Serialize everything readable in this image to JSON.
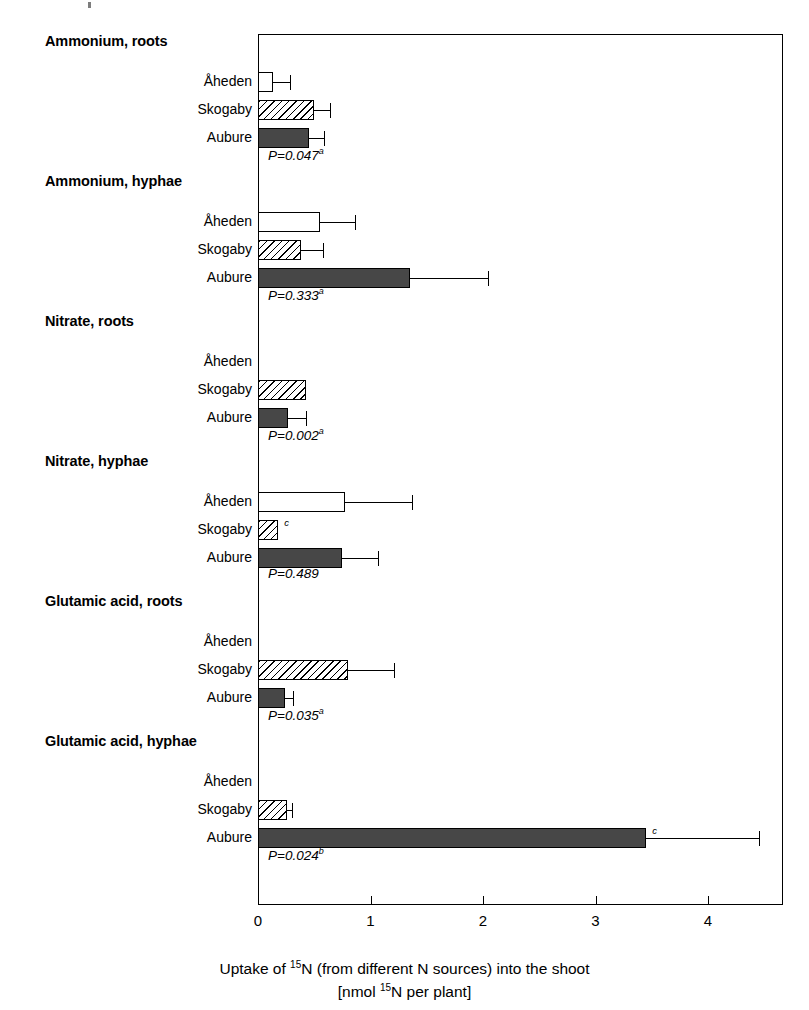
{
  "chart_data": {
    "type": "bar",
    "orientation": "horizontal",
    "title": "",
    "xlabel_line1": "Uptake of ",
    "xlabel_sup1": "15",
    "xlabel_line1b": "N (from different N sources) into the shoot",
    "xlabel_line2a": "[nmol ",
    "xlabel_sup2": "15",
    "xlabel_line2b": "N per plant]",
    "xlabel_plain": "Uptake of 15N (from different N sources) into the shoot [nmol 15N per plant]",
    "ylabel": "",
    "xlim": [
      0,
      4.666
    ],
    "xticks": [
      0,
      1,
      2,
      3,
      4
    ],
    "xticklabels": [
      "0",
      "1",
      "2",
      "3",
      "4"
    ],
    "grid": false,
    "legend_position": "none",
    "site_names": [
      "Åheden",
      "Skogaby",
      "Aubure"
    ],
    "site_styles": [
      "open",
      "hatched",
      "solid"
    ],
    "groups": [
      {
        "header": "Ammonium, roots",
        "p_value": "P=0.047",
        "p_sup": "a",
        "bars": [
          {
            "site": "Åheden",
            "value": 0.13,
            "error": 0.15,
            "marker": ""
          },
          {
            "site": "Skogaby",
            "value": 0.5,
            "error": 0.14,
            "marker": ""
          },
          {
            "site": "Aubure",
            "value": 0.45,
            "error": 0.14,
            "marker": ""
          }
        ]
      },
      {
        "header": "Ammonium, hyphae",
        "p_value": "P=0.333",
        "p_sup": "a",
        "bars": [
          {
            "site": "Åheden",
            "value": 0.55,
            "error": 0.31,
            "marker": ""
          },
          {
            "site": "Skogaby",
            "value": 0.38,
            "error": 0.2,
            "marker": ""
          },
          {
            "site": "Aubure",
            "value": 1.35,
            "error": 0.69,
            "marker": ""
          }
        ]
      },
      {
        "header": "Nitrate, roots",
        "p_value": "P=0.002",
        "p_sup": "a",
        "bars": [
          {
            "site": "Åheden",
            "value": 0.0,
            "error": 0.0,
            "marker": ""
          },
          {
            "site": "Skogaby",
            "value": 0.43,
            "error": 0.0,
            "marker": ""
          },
          {
            "site": "Aubure",
            "value": 0.27,
            "error": 0.16,
            "marker": ""
          }
        ]
      },
      {
        "header": "Nitrate, hyphae",
        "p_value": "P=0.489",
        "p_sup": "",
        "bars": [
          {
            "site": "Åheden",
            "value": 0.77,
            "error": 0.6,
            "marker": ""
          },
          {
            "site": "Skogaby",
            "value": 0.18,
            "error": 0.0,
            "marker": "c"
          },
          {
            "site": "Aubure",
            "value": 0.75,
            "error": 0.32,
            "marker": ""
          }
        ]
      },
      {
        "header": "Glutamic acid, roots",
        "p_value": "P=0.035",
        "p_sup": "a",
        "bars": [
          {
            "site": "Åheden",
            "value": 0.0,
            "error": 0.0,
            "marker": ""
          },
          {
            "site": "Skogaby",
            "value": 0.8,
            "error": 0.41,
            "marker": ""
          },
          {
            "site": "Aubure",
            "value": 0.24,
            "error": 0.07,
            "marker": ""
          }
        ]
      },
      {
        "header": "Glutamic acid, hyphae",
        "p_value": "P=0.024",
        "p_sup": "b",
        "bars": [
          {
            "site": "Åheden",
            "value": 0.0,
            "error": 0.0,
            "marker": ""
          },
          {
            "site": "Skogaby",
            "value": 0.26,
            "error": 0.04,
            "marker": ""
          },
          {
            "site": "Aubure",
            "value": 3.45,
            "error": 1.0,
            "marker": "c"
          }
        ]
      }
    ]
  },
  "colors": {
    "axis": "#000000",
    "bar_open": "#ffffff",
    "bar_hatch_line": "#000000",
    "bar_solid": "#474747",
    "text": "#000000"
  }
}
